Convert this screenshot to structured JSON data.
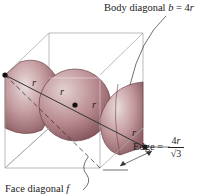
{
  "diagram": {
    "type": "bcc-unit-cell",
    "labels": {
      "body_diagonal_text": "Body diagonal ",
      "body_diagonal_var": "b",
      "body_diagonal_eq": " = 4",
      "body_diagonal_r": "r",
      "edge_text": "Edge = ",
      "edge_num": "4",
      "edge_num_var": "r",
      "edge_den": "√3",
      "face_diagonal_text": "Face diagonal ",
      "face_diagonal_var": "f",
      "radius_marks": [
        "r",
        "r",
        "r",
        "r"
      ]
    },
    "colors": {
      "sphere_fill": "#b98c90",
      "sphere_light": "#e6d5d6",
      "sphere_dark": "#8a5a60",
      "cube_line": "#a8a8a8",
      "ink": "#222222"
    }
  }
}
